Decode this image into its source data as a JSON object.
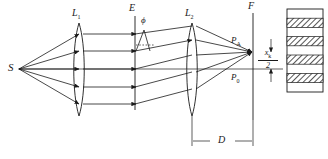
{
  "figure": {
    "type": "optics-ray-diagram",
    "background": "#ffffff",
    "stroke": "#1a1a1a"
  },
  "labels": {
    "source": "S",
    "lens1": "L",
    "lens1_sub": "1",
    "plane_E": "E",
    "angle_phi": "ϕ",
    "lens2": "L",
    "lens2_sub": "2",
    "plane_F": "F",
    "point_PA": "P",
    "point_PA_sub": "A",
    "point_P0": "P",
    "point_P0_sub": "0",
    "distance_D": "D",
    "fringe_spacing_num": "x",
    "fringe_spacing_num_sub": "k",
    "fringe_spacing_den": "2"
  },
  "elements": {
    "source_rays_count": 5,
    "parallel_rays_count": 5,
    "tilted_rays_count": 5,
    "converging_rays_count": 5,
    "fringe_bands_total": 9,
    "fringe_bands_hatched": 4,
    "fringe_bands_clear": 5,
    "optical_axis": "horizontal centre line"
  },
  "geometry": {
    "source_x": 18,
    "source_y": 69,
    "lens1_x": 79,
    "lens1_top": 23,
    "lens1_bottom": 116,
    "plane_E_x": 135,
    "plane_E_top": 16,
    "plane_E_bottom": 110,
    "lens2_x": 192,
    "lens2_top": 23,
    "lens2_bottom": 116,
    "plane_F_x": 253,
    "plane_F_top": 13,
    "plane_F_bottom": 120,
    "focus_PA_x": 253,
    "focus_PA_y": 52,
    "screen_x": 287,
    "screen_w": 36,
    "screen_top": 9,
    "screen_bottom": 92
  }
}
